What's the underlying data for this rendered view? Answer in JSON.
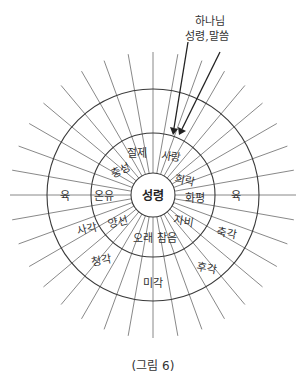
{
  "diagram": {
    "top_label": {
      "line1": "하나님",
      "line2": "성령,말씀"
    },
    "center": {
      "label": "성령"
    },
    "inner_ring": {
      "labels": [
        "절제",
        "사랑",
        "충성",
        "희락",
        "온유",
        "화평",
        "양선",
        "자비",
        "오래 참음"
      ]
    },
    "outer_ring": {
      "labels": [
        "육",
        "육",
        "사각",
        "청각",
        "미각",
        "후각",
        "축각"
      ]
    },
    "caption": "(그림 6)",
    "geometry": {
      "center_x": 153,
      "center_y": 195,
      "inner_radius": 22,
      "middle_radius": 62,
      "outer_radius": 106,
      "ray_length": 143,
      "ray_count": 36
    }
  }
}
